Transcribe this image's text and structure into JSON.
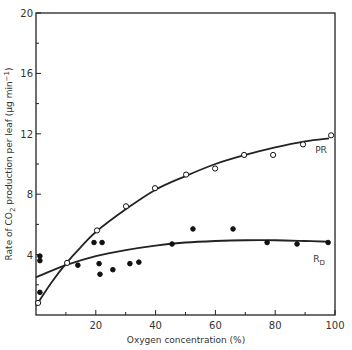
{
  "chart_data": {
    "type": "scatter",
    "title": "",
    "xlabel": "Oxygen concentration (%)",
    "ylabel": "Rate of CO2 production per leaf (µg min⁻¹)",
    "xlim": [
      0,
      100
    ],
    "ylim": [
      0,
      20
    ],
    "xticks": [
      20,
      40,
      60,
      80,
      100
    ],
    "xminor_ticks": [
      10,
      30,
      50,
      70,
      90
    ],
    "yticks": [
      4,
      8,
      12,
      16,
      20
    ],
    "yminor_ticks": [
      2,
      6,
      10,
      14,
      18
    ],
    "grid": false,
    "series": [
      {
        "name": "PR",
        "marker": "open-circle",
        "points": [
          {
            "x": 0.7,
            "y": 0.8
          },
          {
            "x": 10.4,
            "y": 3.45
          },
          {
            "x": 20.4,
            "y": 5.6
          },
          {
            "x": 30.1,
            "y": 7.2
          },
          {
            "x": 39.8,
            "y": 8.4
          },
          {
            "x": 50.2,
            "y": 9.3
          },
          {
            "x": 59.9,
            "y": 9.7
          },
          {
            "x": 69.6,
            "y": 10.6
          },
          {
            "x": 79.3,
            "y": 10.6
          },
          {
            "x": 89.3,
            "y": 11.3
          },
          {
            "x": 98.7,
            "y": 11.9
          }
        ],
        "fit_curve": [
          {
            "x": 0,
            "y": 0.6
          },
          {
            "x": 5,
            "y": 2.1
          },
          {
            "x": 10,
            "y": 3.4
          },
          {
            "x": 15,
            "y": 4.5
          },
          {
            "x": 20,
            "y": 5.5
          },
          {
            "x": 30,
            "y": 7.0
          },
          {
            "x": 40,
            "y": 8.3
          },
          {
            "x": 50,
            "y": 9.2
          },
          {
            "x": 60,
            "y": 10.0
          },
          {
            "x": 70,
            "y": 10.6
          },
          {
            "x": 80,
            "y": 11.1
          },
          {
            "x": 90,
            "y": 11.5
          },
          {
            "x": 98,
            "y": 11.7
          }
        ]
      },
      {
        "name": "RD",
        "marker": "filled-circle",
        "points": [
          {
            "x": 1.3,
            "y": 3.9
          },
          {
            "x": 1.3,
            "y": 3.6
          },
          {
            "x": 1.3,
            "y": 1.5
          },
          {
            "x": 14.0,
            "y": 3.3
          },
          {
            "x": 19.4,
            "y": 4.8
          },
          {
            "x": 22.1,
            "y": 4.8
          },
          {
            "x": 21.1,
            "y": 3.4
          },
          {
            "x": 21.4,
            "y": 2.7
          },
          {
            "x": 25.7,
            "y": 3.0
          },
          {
            "x": 31.4,
            "y": 3.4
          },
          {
            "x": 34.4,
            "y": 3.5
          },
          {
            "x": 45.5,
            "y": 4.7
          },
          {
            "x": 52.5,
            "y": 5.7
          },
          {
            "x": 65.9,
            "y": 5.7
          },
          {
            "x": 77.3,
            "y": 4.8
          },
          {
            "x": 87.3,
            "y": 4.7
          },
          {
            "x": 97.7,
            "y": 4.8
          }
        ],
        "fit_curve": [
          {
            "x": 0,
            "y": 2.5
          },
          {
            "x": 10,
            "y": 3.3
          },
          {
            "x": 20,
            "y": 3.9
          },
          {
            "x": 30,
            "y": 4.3
          },
          {
            "x": 40,
            "y": 4.6
          },
          {
            "x": 50,
            "y": 4.8
          },
          {
            "x": 60,
            "y": 4.9
          },
          {
            "x": 70,
            "y": 4.95
          },
          {
            "x": 80,
            "y": 4.95
          },
          {
            "x": 90,
            "y": 4.9
          },
          {
            "x": 98,
            "y": 4.85
          }
        ]
      }
    ],
    "annotations": [
      {
        "text": "PR",
        "x": 93,
        "y": 10.6
      },
      {
        "text": "RD",
        "x": 93,
        "y": 3.9
      }
    ]
  }
}
